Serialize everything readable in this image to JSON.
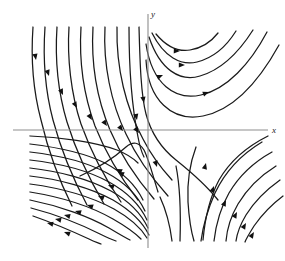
{
  "figure": {
    "kind": "phase-portrait",
    "background_color": "#ffffff",
    "curve_color": "#1a1a1a",
    "axis_color": "#8d8d8d",
    "arrow_color": "#111111"
  },
  "axes": {
    "x_label": "x",
    "y_label": "y",
    "origin": {
      "x": 148,
      "y": 130
    },
    "x_axis": {
      "x1": 13,
      "y1": 130,
      "x2": 268,
      "y2": 130
    },
    "y_axis": {
      "x1": 148,
      "y1": 14,
      "x2": 148,
      "y2": 248
    },
    "x_label_pos": {
      "x": 272,
      "y": 133
    },
    "y_label_pos": {
      "x": 151,
      "y": 17
    }
  },
  "chart_data": {
    "type": "line",
    "title": "",
    "xlabel": "x",
    "ylabel": "y",
    "grid": false,
    "legend": "none",
    "trajectories": [
      {
        "id": "ul-1",
        "quadrant": "upper-left",
        "path": "M 33 27 C 31 55, 33 90, 41 120 C 48 150, 58 178, 72 206"
      },
      {
        "id": "ul-2",
        "quadrant": "upper-left",
        "path": "M 45 27 C 43 56, 45 90, 53 120 C 61 150, 72 177, 87 205"
      },
      {
        "id": "ul-3",
        "quadrant": "upper-left",
        "path": "M 57 27 C 55 57, 58 92, 67 122 C 76 151, 88 177, 104 204"
      },
      {
        "id": "ul-4",
        "quadrant": "upper-left",
        "path": "M 69 27 C 67 58, 71 94, 81 124 C 91 152, 104 177, 121 202"
      },
      {
        "id": "ul-5",
        "quadrant": "upper-left",
        "path": "M 81 27 C 79 60, 84 96, 95 126 C 106 154, 120 177, 138 200"
      },
      {
        "id": "ul-6",
        "quadrant": "upper-left",
        "path": "M 93 27 C 91 62, 97 99, 110 130 C 121 156, 136 178, 154 199"
      },
      {
        "id": "ul-7",
        "quadrant": "upper-left",
        "path": "M 105 27 C 103 64, 111 103, 126 134 C 137 158, 151 177, 168 196"
      },
      {
        "id": "ul-8",
        "quadrant": "upper-left",
        "path": "M 117 27 C 116 68, 126 108, 143 139 C 152 157, 161 168, 172 180"
      },
      {
        "id": "sep-in",
        "quadrant": "upper-left-separatrix",
        "path": "M 129 27 C 129 72, 133 112, 138 137 C 140 148, 142 153, 144 157"
      },
      {
        "id": "sep-main",
        "quadrant": "separatrix",
        "path": "M 139 27 C 140 64, 141 95, 146 114 C 151 133, 161 148, 176 160 C 191 172, 206 185, 218 200"
      },
      {
        "id": "ur-1",
        "quadrant": "upper-right",
        "path": "M 156 34 C 166 46, 178 52, 190 50 C 202 48, 211 42, 218 33"
      },
      {
        "id": "ur-2",
        "quadrant": "upper-right",
        "path": "M 152 33 C 164 57, 181 66, 197 62 C 213 58, 226 47, 236 31"
      },
      {
        "id": "ur-3",
        "quadrant": "upper-right",
        "path": "M 149 37 C 160 70, 180 82, 200 76 C 221 70, 239 52, 253 30"
      },
      {
        "id": "ur-4",
        "quadrant": "upper-right",
        "path": "M 146 44 C 152 84, 175 101, 201 95 C 227 89, 250 64, 267 32"
      },
      {
        "id": "ur-5",
        "quadrant": "upper-right",
        "path": "M 146 60 C 148 100, 172 122, 203 116 C 233 110, 258 83, 279 45"
      },
      {
        "id": "ll-1",
        "quadrant": "lower-left",
        "path": "M 30 144 C 55 147, 83 152, 105 163 C 124 173, 136 186, 143 200"
      },
      {
        "id": "ll-2",
        "quadrant": "lower-left",
        "path": "M 30 152 C 56 155, 85 161, 107 173 C 126 183, 138 196, 145 211"
      },
      {
        "id": "ll-3",
        "quadrant": "lower-left",
        "path": "M 30 160 C 57 163, 87 170, 109 182 C 127 192, 140 205, 147 220"
      },
      {
        "id": "ll-4",
        "quadrant": "lower-left",
        "path": "M 30 168 C 58 171, 89 179, 111 191 C 129 201, 141 213, 148 228"
      },
      {
        "id": "ll-5",
        "quadrant": "lower-left",
        "path": "M 30 176 C 59 179, 91 188, 113 200 C 130 210, 142 221, 149 235"
      },
      {
        "id": "ll-6",
        "quadrant": "lower-left",
        "path": "M 30 184 C 60 188, 92 197, 114 209 C 130 218, 141 228, 147 238"
      },
      {
        "id": "ll-7",
        "quadrant": "lower-left",
        "path": "M 30 192 C 61 197, 92 207, 113 219 C 127 227, 136 234, 141 239"
      },
      {
        "id": "ll-8",
        "quadrant": "lower-left",
        "path": "M 30 200 C 60 206, 90 217, 109 228 C 119 234, 126 238, 130 240"
      },
      {
        "id": "ll-9",
        "quadrant": "lower-left",
        "path": "M 31 208 C 58 215, 84 226, 100 234 C 108 238, 113 240, 116 241"
      },
      {
        "id": "ll-10",
        "quadrant": "lower-left",
        "path": "M 33 216 C 56 224, 76 233, 89 239 C 95 242, 99 243, 101 244"
      },
      {
        "id": "ll-hump",
        "quadrant": "lower-left-hump",
        "path": "M 30 136 C 60 137, 95 142, 117 150 C 127 154, 133 158, 138 163"
      },
      {
        "id": "hump-top",
        "quadrant": "center-hump",
        "path": "M 80 176 C 98 168, 115 157, 126 147 C 133 141, 139 142, 144 150 C 149 160, 153 176, 158 192"
      },
      {
        "id": "lr-1",
        "quadrant": "lower-right",
        "path": "M 268 136 C 248 146, 230 161, 219 180 C 210 197, 205 218, 203 240"
      },
      {
        "id": "lr-2",
        "quadrant": "lower-right",
        "path": "M 272 152 C 254 162, 239 176, 229 193 C 221 207, 216 224, 214 241"
      },
      {
        "id": "lr-3",
        "quadrant": "lower-right",
        "path": "M 276 166 C 260 176, 247 189, 238 204 C 231 216, 227 229, 226 241"
      },
      {
        "id": "lr-4",
        "quadrant": "lower-right",
        "path": "M 280 180 C 266 190, 254 202, 246 215 C 240 225, 237 234, 236 241"
      },
      {
        "id": "lr-5",
        "quadrant": "lower-right",
        "path": "M 283 196 C 271 205, 261 216, 254 226 C 249 234, 246 239, 245 242"
      },
      {
        "id": "lr-6",
        "quadrant": "lower-right",
        "path": "M 262 142 C 242 154, 225 172, 215 193 C 207 211, 203 226, 201 241"
      },
      {
        "id": "lr-in",
        "quadrant": "lower-right-inner",
        "path": "M 196 147 C 190 163, 187 182, 188 202 C 189 218, 191 231, 194 241"
      },
      {
        "id": "lc-1",
        "quadrant": "lower-center",
        "path": "M 160 197 C 166 210, 170 225, 172 241"
      },
      {
        "id": "lc-2",
        "quadrant": "lower-center",
        "path": "M 176 166 C 180 186, 181 210, 180 241"
      }
    ],
    "arrows": [
      {
        "x": 36,
        "y": 60,
        "angle": 80,
        "on": "ul-1"
      },
      {
        "x": 49,
        "y": 76,
        "angle": 72,
        "on": "ul-2"
      },
      {
        "x": 63,
        "y": 95,
        "angle": 66,
        "on": "ul-3"
      },
      {
        "x": 77,
        "y": 108,
        "angle": 62,
        "on": "ul-4"
      },
      {
        "x": 92,
        "y": 120,
        "angle": 58,
        "on": "ul-5"
      },
      {
        "x": 107,
        "y": 126,
        "angle": 55,
        "on": "ul-6"
      },
      {
        "x": 123,
        "y": 131,
        "angle": 52,
        "on": "ul-7"
      },
      {
        "x": 139,
        "y": 133,
        "angle": 53,
        "on": "ul-8"
      },
      {
        "x": 137,
        "y": 120,
        "angle": 78,
        "on": "sep-in"
      },
      {
        "x": 144,
        "y": 103,
        "angle": 80,
        "on": "sep-main"
      },
      {
        "x": 180,
        "y": 51,
        "angle": 2,
        "on": "ur-1"
      },
      {
        "x": 185,
        "y": 65,
        "angle": 0,
        "on": "ur-2"
      },
      {
        "x": 163,
        "y": 75,
        "angle": 338,
        "on": "ur-3"
      },
      {
        "x": 209,
        "y": 92,
        "angle": 340,
        "on": "ur-4"
      },
      {
        "x": 116,
        "y": 169,
        "angle": 204,
        "on": "hump-top"
      },
      {
        "x": 157,
        "y": 167,
        "angle": 72,
        "on": "hump-top"
      },
      {
        "x": 118,
        "y": 172,
        "angle": 205,
        "on": "ll-1"
      },
      {
        "x": 108,
        "y": 185,
        "angle": 202,
        "on": "ll-2"
      },
      {
        "x": 98,
        "y": 196,
        "angle": 200,
        "on": "ll-3"
      },
      {
        "x": 87,
        "y": 205,
        "angle": 198,
        "on": "ll-4"
      },
      {
        "x": 75,
        "y": 211,
        "angle": 196,
        "on": "ll-5"
      },
      {
        "x": 64,
        "y": 215,
        "angle": 194,
        "on": "ll-6"
      },
      {
        "x": 55,
        "y": 219,
        "angle": 192,
        "on": "ll-7"
      },
      {
        "x": 47,
        "y": 223,
        "angle": 192,
        "on": "ll-8"
      },
      {
        "x": 64,
        "y": 232,
        "angle": 200,
        "on": "ll-9"
      },
      {
        "x": 214,
        "y": 186,
        "angle": 290,
        "on": "lr-1"
      },
      {
        "x": 226,
        "y": 200,
        "angle": 295,
        "on": "lr-2"
      },
      {
        "x": 237,
        "y": 212,
        "angle": 298,
        "on": "lr-3"
      },
      {
        "x": 246,
        "y": 223,
        "angle": 300,
        "on": "lr-4"
      },
      {
        "x": 254,
        "y": 232,
        "angle": 302,
        "on": "lr-5"
      },
      {
        "x": 206,
        "y": 163,
        "angle": 285,
        "on": "lr-6"
      }
    ]
  }
}
